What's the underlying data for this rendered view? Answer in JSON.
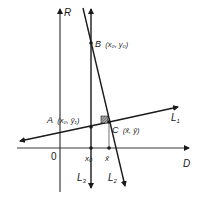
{
  "diagram": {
    "axes": {
      "vertical_label": "R",
      "horizontal_label": "D",
      "origin_label": "0"
    },
    "lines": [
      {
        "id": "L1",
        "label": "L",
        "subscript": "1"
      },
      {
        "id": "L2",
        "label": "L",
        "subscript": "2"
      },
      {
        "id": "L3",
        "label": "L",
        "subscript": "3"
      }
    ],
    "points": {
      "A": {
        "name": "A",
        "coords": "(x₀, ȳ₁)"
      },
      "B": {
        "name": "B",
        "coords": "(x₀, y₀)"
      },
      "C": {
        "name": "C",
        "coords": "(x̄, ȳ)"
      }
    },
    "ticks": {
      "x0": "x₀",
      "xbar": "x̄"
    },
    "colors": {
      "ink": "#1a1a1a",
      "axis": "#3a3a3a",
      "dropline": "#888888",
      "background": "#ffffff"
    }
  }
}
